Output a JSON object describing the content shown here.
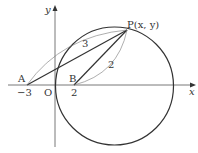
{
  "diagram": {
    "axes": {
      "x_label": "x",
      "y_label": "y",
      "origin_label": "O"
    },
    "points": {
      "A": {
        "label": "A",
        "tick": "−3"
      },
      "B": {
        "label": "B",
        "tick": "2"
      },
      "P": {
        "label": "P(x, y)"
      }
    },
    "distances": {
      "PA": "3",
      "PB": "2"
    },
    "colors": {
      "stroke": "#333333",
      "thin": "#666666",
      "background": "#ffffff"
    }
  }
}
